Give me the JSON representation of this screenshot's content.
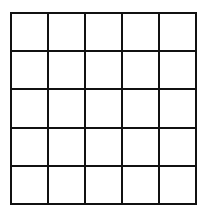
{
  "grid": {
    "rows": 5,
    "columns": 5,
    "line_color": "#111111",
    "cell_fill": "#ffffff",
    "cells": [
      [
        "",
        "",
        "",
        "",
        ""
      ],
      [
        "",
        "",
        "",
        "",
        ""
      ],
      [
        "",
        "",
        "",
        "",
        ""
      ],
      [
        "",
        "",
        "",
        "",
        ""
      ],
      [
        "",
        "",
        "",
        "",
        ""
      ]
    ]
  }
}
